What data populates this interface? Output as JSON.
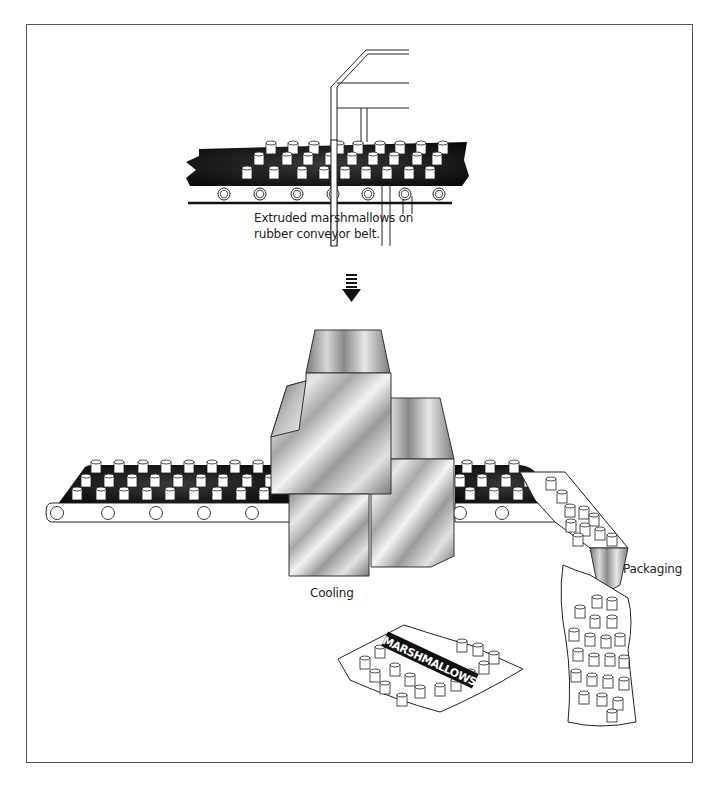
{
  "diagram": {
    "steps": [
      {
        "id": "extrusion",
        "label_line1": "Extruded marshmallows on",
        "label_line2": "rubber conveyor belt."
      },
      {
        "id": "cooling",
        "label": "Cooling"
      },
      {
        "id": "packaging",
        "label": "Packaging"
      }
    ],
    "bag_label": "MARSHMALLOWS",
    "flow_arrow": "down-arrow-icon",
    "colors": {
      "belt": "#111111",
      "outline": "#222222",
      "background": "#ffffff",
      "metal_light": "#f2f2f2",
      "metal_dark": "#6a6a6a"
    }
  }
}
